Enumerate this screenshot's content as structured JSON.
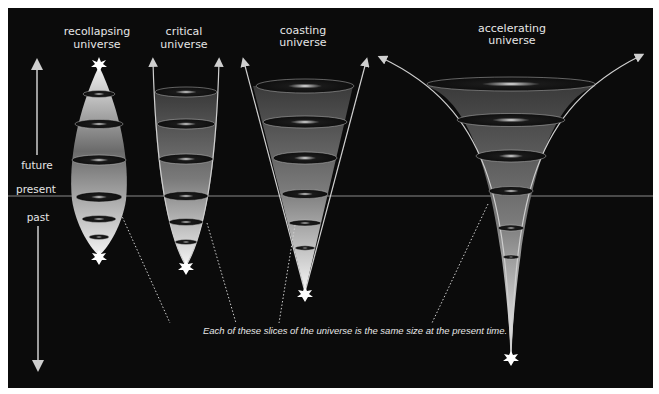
{
  "diagram": {
    "models": [
      {
        "id": "recollapsing",
        "title_line1": "recollapsing",
        "title_line2": "universe"
      },
      {
        "id": "critical",
        "title_line1": "critical",
        "title_line2": "universe"
      },
      {
        "id": "coasting",
        "title_line1": "coasting",
        "title_line2": "universe"
      },
      {
        "id": "accelerating",
        "title_line1": "accelerating",
        "title_line2": "universe"
      }
    ],
    "time_axis": {
      "future_label": "future",
      "present_label": "present",
      "past_label": "past"
    },
    "caption": "Each of these slices of the universe is the same size at the present time.",
    "colors": {
      "background": "#0b0b0b",
      "present_line": "#8a8a8a",
      "cone_light": "#f2f2f2",
      "cone_dark": "#5a5a5a",
      "label": "#e6e6e6"
    }
  }
}
